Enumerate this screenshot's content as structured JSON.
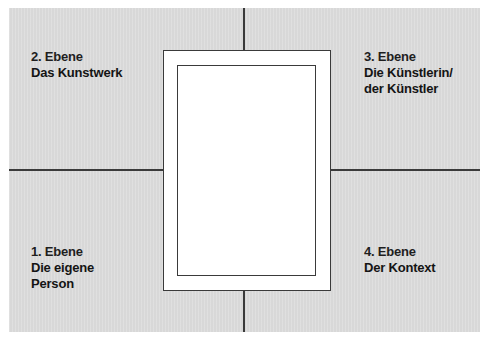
{
  "diagram": {
    "type": "four-quadrant-frame",
    "colors": {
      "background": "#dcdcdc",
      "lines": "#3a3a3a",
      "frame_fill": "#ffffff",
      "text": "#141414"
    },
    "quadrants": {
      "top_left": {
        "level": "2. Ebene",
        "lines": [
          "Das Kunstwerk"
        ]
      },
      "top_right": {
        "level": "3. Ebene",
        "lines": [
          "Die Künstlerin/",
          "der Künstler"
        ]
      },
      "bottom_left": {
        "level": "1. Ebene",
        "lines": [
          "Die eigene",
          "Person"
        ]
      },
      "bottom_right": {
        "level": "4. Ebene",
        "lines": [
          "Der Kontext"
        ]
      }
    },
    "center": {
      "description": "empty picture frame (double rectangle)"
    }
  }
}
